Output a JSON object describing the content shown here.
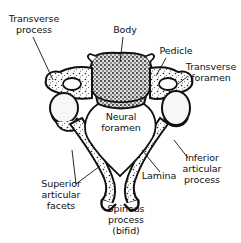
{
  "diagram": {
    "colors": {
      "ink": "#111111",
      "background": "#ffffff",
      "bone_fill": "#f4f4f4"
    },
    "labels": {
      "transverse_process": {
        "line1": "Transverse",
        "line2": "process"
      },
      "body": {
        "line1": "Body"
      },
      "pedicle": {
        "line1": "Pedicle"
      },
      "transverse_foramen": {
        "line1": "Transverse",
        "line2": "foramen"
      },
      "neural_foramen": {
        "line1": "Neural",
        "line2": "foramen"
      },
      "inferior_articular_process": {
        "line1": "Inferior",
        "line2": "articular",
        "line3": "process"
      },
      "lamina": {
        "line1": "Lamina"
      },
      "superior_articular_facets": {
        "line1": "Superior",
        "line2": "articular",
        "line3": "facets"
      },
      "spinous_process": {
        "line1": "Spinous",
        "line2": "process",
        "line3": "(bifid)"
      }
    }
  }
}
